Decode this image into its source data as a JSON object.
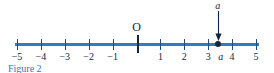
{
  "figure": {
    "caption": "Figure 2",
    "caption_color": "#2f7cc0",
    "axis_color": "#2f7cc0",
    "ink_color": "#11263f"
  },
  "number_line": {
    "min": -5,
    "max": 5,
    "origin_label": "O",
    "ticks": [
      {
        "value": -5,
        "label": "−5"
      },
      {
        "value": -4,
        "label": "−4"
      },
      {
        "value": -3,
        "label": "−3"
      },
      {
        "value": -2,
        "label": "−2"
      },
      {
        "value": -1,
        "label": "−1"
      },
      {
        "value": 0,
        "label": ""
      },
      {
        "value": 1,
        "label": "1"
      },
      {
        "value": 2,
        "label": "2"
      },
      {
        "value": 3,
        "label": "3"
      },
      {
        "value": 4,
        "label": "4"
      },
      {
        "value": 5,
        "label": "5"
      }
    ]
  },
  "marked_point": {
    "label": "a",
    "axis_label": "a",
    "value": 3.4,
    "arrow": "down-arrow"
  }
}
